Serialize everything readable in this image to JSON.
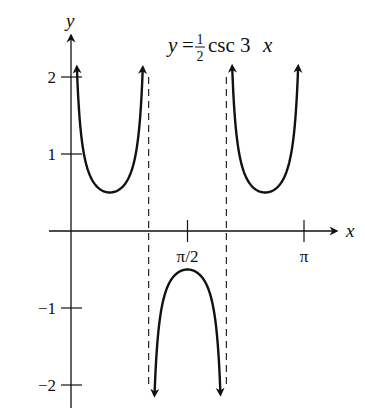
{
  "chart_data": {
    "type": "line",
    "title_parts": {
      "lhs": "y",
      "eq": "=",
      "num": "1",
      "den": "2",
      "func": "csc 3",
      "var": "x"
    },
    "xlabel": "x",
    "ylabel": "y",
    "x_ticks": [
      {
        "value": 1.5708,
        "label": "π/2"
      },
      {
        "value": 3.1416,
        "label": "π"
      }
    ],
    "y_ticks": [
      {
        "value": 2,
        "label": "2"
      },
      {
        "value": 1,
        "label": "1"
      },
      {
        "value": -1,
        "label": "−1"
      },
      {
        "value": -2,
        "label": "−2"
      }
    ],
    "xlim": [
      -0.3,
      3.55
    ],
    "ylim": [
      -2.3,
      2.35
    ],
    "asymptotes": [
      1.0472,
      2.0944
    ],
    "function": "0.5/sin(3x)",
    "branches": [
      {
        "x_start": 0.08,
        "x_end": 0.967,
        "min_point": [
          0.5236,
          0.5
        ]
      },
      {
        "x_start": 1.127,
        "x_end": 2.014,
        "max_point": [
          1.5708,
          -0.5
        ]
      },
      {
        "x_start": 2.174,
        "x_end": 3.062,
        "min_point": [
          2.618,
          0.5
        ]
      }
    ],
    "grid": false,
    "legend": null
  }
}
